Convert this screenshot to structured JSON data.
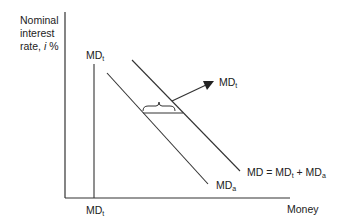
{
  "diagram": {
    "type": "money-demand",
    "y_axis": {
      "label_line1": "Nominal",
      "label_line2": "interest",
      "label_line3_prefix": "rate, ",
      "label_var": "i",
      "label_unit": " %"
    },
    "x_axis": {
      "label": "Money"
    },
    "curves": [
      {
        "name": "MD_t",
        "base": "MD",
        "sub": "t",
        "shape": "vertical"
      },
      {
        "name": "MD_a",
        "base": "MD",
        "sub": "a",
        "shape": "downward-sloping"
      },
      {
        "name": "MD",
        "label_prefix": "MD = MD",
        "sub1": "t",
        "mid": " + MD",
        "sub2": "a",
        "shape": "downward-sloping"
      }
    ],
    "labels": {
      "top_vertical": {
        "base": "MD",
        "sub": "t"
      },
      "arrow_target": {
        "base": "MD",
        "sub": "t"
      },
      "bottom_axis": {
        "base": "MD",
        "sub": "t"
      },
      "mda": {
        "base": "MD",
        "sub": "a"
      },
      "md_sum": {
        "prefix": "MD = MD",
        "sub1": "t",
        "mid": " + MD",
        "sub2": "a"
      }
    },
    "colors": {
      "line": "#333333",
      "background": "#ffffff"
    }
  }
}
